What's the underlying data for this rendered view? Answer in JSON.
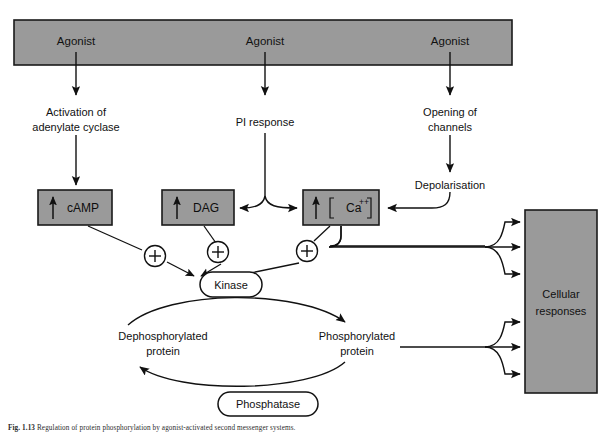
{
  "figure": {
    "caption_label": "Fig. 1.13",
    "caption_text": "Regulation of protein phosphorylation by agonist-activated second messenger systems."
  },
  "banner": {
    "name": "agonist-banner",
    "fill": "#9a9a9a",
    "stroke": "#1a1a1a",
    "agonists": [
      {
        "label": "Agonist"
      },
      {
        "label": "Agonist"
      },
      {
        "label": "Agonist"
      }
    ]
  },
  "pathways": {
    "camp_pathway": {
      "step_line1": "Activation of",
      "step_line2": "adenylate cyclase"
    },
    "pi_pathway": {
      "step": "PI response"
    },
    "calcium_pathway": {
      "step_line1": "Opening of",
      "step_line2": "channels",
      "step2": "Depolarisation"
    }
  },
  "messenger_boxes": [
    {
      "id": "camp-box",
      "label": "cAMP",
      "arrow": "up",
      "bracketed": false
    },
    {
      "id": "dag-box",
      "label": "DAG",
      "arrow": "up",
      "bracketed": false
    },
    {
      "id": "calcium-box",
      "label": "Ca",
      "superscript": "++",
      "arrow": "up",
      "bracketed": true
    }
  ],
  "plus_signs": [
    {
      "id": "plus-camp",
      "symbol": "+"
    },
    {
      "id": "plus-dag",
      "symbol": "+"
    },
    {
      "id": "plus-calcium",
      "symbol": "+"
    }
  ],
  "enzymes": {
    "kinase": {
      "label": "Kinase"
    },
    "phosphatase": {
      "label": "Phosphatase"
    }
  },
  "protein_states": {
    "dephosphorylated": {
      "line1": "Dephosphorylated",
      "line2": "protein"
    },
    "phosphorylated": {
      "line1": "Phosphorylated",
      "line2": "protein"
    }
  },
  "cellular_responses": {
    "line1": "Cellular",
    "line2": "responses",
    "fill": "#9a9a9a",
    "stroke": "#1a1a1a",
    "inbound_arrow_count": 6
  },
  "colors": {
    "box_fill": "#9a9a9a",
    "outline": "#111111",
    "background": "#ffffff"
  }
}
